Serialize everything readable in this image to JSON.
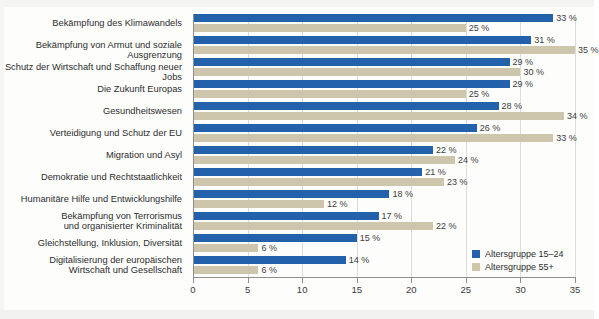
{
  "chart_data": {
    "type": "bar",
    "orientation": "horizontal",
    "title": "",
    "subtitle": "",
    "xlabel": "",
    "ylabel": "",
    "xlim": [
      0,
      35
    ],
    "xticks": [
      "0",
      "5",
      "10",
      "15",
      "20",
      "25",
      "30",
      "35"
    ],
    "grid": true,
    "legend_position": "right-bottom",
    "value_suffix": " %",
    "categories": [
      "Bekämpfung des Klimawandels",
      "Bekämpfung von Armut und soziale Ausgrenzung",
      "Schutz der Wirtschaft und Schaffung neuer Jobs",
      "Die Zukunft Europas",
      "Gesundheitswesen",
      "Verteidigung und Schutz der EU",
      "Migration und Asyl",
      "Demokratie und Rechtstaatlichkeit",
      "Humanitäre Hilfe und Entwicklungshilfe",
      "Bekämpfung von Terrorismus und organisierter Kriminalität",
      "Gleichstellung, Inklusion, Diversität",
      "Digitalisierung der europäischen Wirtschaft und Gesellschaft"
    ],
    "categories_lines": [
      [
        "Bekämpfung des Klimawandels"
      ],
      [
        "Bekämpfung von Armut und soziale Ausgrenzung"
      ],
      [
        "Schutz der Wirtschaft und Schaffung neuer Jobs"
      ],
      [
        "Die Zukunft Europas"
      ],
      [
        "Gesundheitswesen"
      ],
      [
        "Verteidigung und Schutz der EU"
      ],
      [
        "Migration und Asyl"
      ],
      [
        "Demokratie und Rechtstaatlichkeit"
      ],
      [
        "Humanitäre Hilfe und Entwicklungshilfe"
      ],
      [
        "Bekämpfung von Terrorismus",
        "und organisierter Kriminalität"
      ],
      [
        "Gleichstellung, Inklusion, Diversität"
      ],
      [
        "Digitalisierung der europäischen",
        "Wirtschaft und Gesellschaft"
      ]
    ],
    "series": [
      {
        "name": "Altersgruppe 15–24",
        "color": "#2361ab",
        "values": [
          33,
          31,
          29,
          29,
          28,
          26,
          22,
          21,
          18,
          17,
          15,
          14
        ],
        "labels": [
          "33 %",
          "31 %",
          "29 %",
          "29 %",
          "28 %",
          "26 %",
          "22 %",
          "21 %",
          "18 %",
          "17 %",
          "15 %",
          "14 %"
        ]
      },
      {
        "name": "Altersgruppe 55+",
        "color": "#cdc6ad",
        "values": [
          25,
          35,
          30,
          25,
          34,
          33,
          24,
          23,
          12,
          22,
          6,
          6
        ],
        "labels": [
          "25 %",
          "35 %",
          "30 %",
          "25 %",
          "34 %",
          "33 %",
          "24 %",
          "23 %",
          "12 %",
          "22 %",
          "6 %",
          "6 %"
        ]
      }
    ]
  },
  "legend": {
    "items": [
      {
        "label": "Altersgruppe 15–24",
        "color": "#2361ab"
      },
      {
        "label": "Altersgruppe 55+",
        "color": "#cdc6ad"
      }
    ]
  }
}
